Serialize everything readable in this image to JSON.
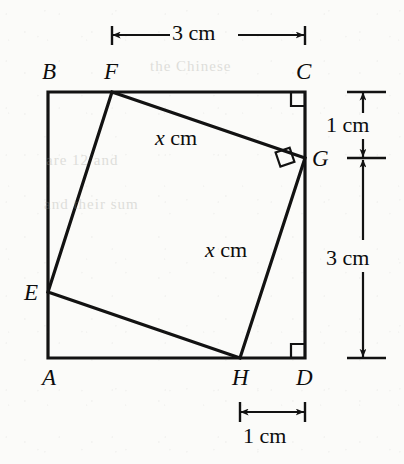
{
  "figure": {
    "type": "geometry-diagram",
    "stroke_color": "#121212",
    "background_color": "#fbfbf9",
    "square": {
      "name": "ABCD",
      "vertices": [
        {
          "label": "A",
          "x": 48,
          "y": 358,
          "label_x": 42,
          "label_y": 366
        },
        {
          "label": "B",
          "x": 48,
          "y": 92,
          "label_x": 42,
          "label_y": 60
        },
        {
          "label": "C",
          "x": 305,
          "y": 92,
          "label_x": 296,
          "label_y": 60
        },
        {
          "label": "D",
          "x": 305,
          "y": 358,
          "label_x": 296,
          "label_y": 366
        }
      ]
    },
    "inner_quadrilateral": {
      "name": "EFGH",
      "vertices": [
        {
          "label": "E",
          "x": 48,
          "y": 292,
          "label_x": 24,
          "label_y": 281
        },
        {
          "label": "F",
          "x": 112,
          "y": 92,
          "label_x": 104,
          "label_y": 60
        },
        {
          "label": "G",
          "x": 305,
          "y": 158,
          "label_x": 312,
          "label_y": 147
        },
        {
          "label": "H",
          "x": 240,
          "y": 358,
          "label_x": 232,
          "label_y": 366
        }
      ]
    },
    "right_angle_marks": [
      {
        "at": "C",
        "description": "right angle at corner C"
      },
      {
        "at": "G",
        "description": "right angle between FG and GH at G"
      },
      {
        "at": "D",
        "description": "right angle at corner D"
      }
    ],
    "side_labels": [
      {
        "id": "fg-length",
        "var": "x",
        "unit": "cm",
        "x": 155,
        "y": 127,
        "segment": "FG"
      },
      {
        "id": "gh-length",
        "var": "x",
        "unit": "cm",
        "x": 205,
        "y": 239,
        "segment": "GH"
      }
    ],
    "dimensions": [
      {
        "id": "top-dimension",
        "text": "3 cm",
        "orientation": "horizontal",
        "from": "F",
        "to": "C",
        "x1": 112,
        "x2": 305,
        "y": 35,
        "label_x": 172,
        "label_y": 22
      },
      {
        "id": "right-upper-dimension",
        "text": "1 cm",
        "orientation": "vertical",
        "from": "C",
        "to": "G",
        "x": 363,
        "y1": 92,
        "y2": 158,
        "label_x": 326,
        "label_y": 114
      },
      {
        "id": "right-lower-dimension",
        "text": "3 cm",
        "orientation": "vertical",
        "from": "G",
        "to": "D",
        "x": 363,
        "y1": 158,
        "y2": 358,
        "label_x": 326,
        "label_y": 247
      },
      {
        "id": "bottom-dimension",
        "text": "1 cm",
        "orientation": "horizontal",
        "from": "H",
        "to": "D",
        "x1": 240,
        "x2": 305,
        "y": 412,
        "label_x": 243,
        "label_y": 425
      }
    ],
    "background_ghost_text": [
      {
        "id": "ghost-1",
        "text": "the Chinese",
        "x": 150,
        "y": 58
      },
      {
        "id": "ghost-2",
        "text": "are 12 and",
        "x": 46,
        "y": 152
      },
      {
        "id": "ghost-3",
        "text": "and their sum",
        "x": 44,
        "y": 196
      }
    ]
  }
}
